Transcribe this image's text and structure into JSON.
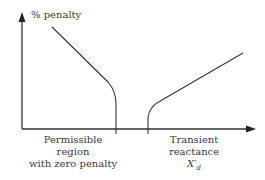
{
  "diagram": {
    "y_axis_label": "% penalty",
    "x_axis_label_line1": "Transient",
    "x_axis_label_line2": "reactance",
    "x_axis_symbol": "X",
    "x_axis_symbol_prime": "′",
    "x_axis_symbol_subscript": "d",
    "region_label_line1": "Permissible",
    "region_label_line2": "region",
    "region_label_line3": "with zero penalty"
  },
  "colors": {
    "line": "#333333",
    "background": "#ffffff"
  }
}
